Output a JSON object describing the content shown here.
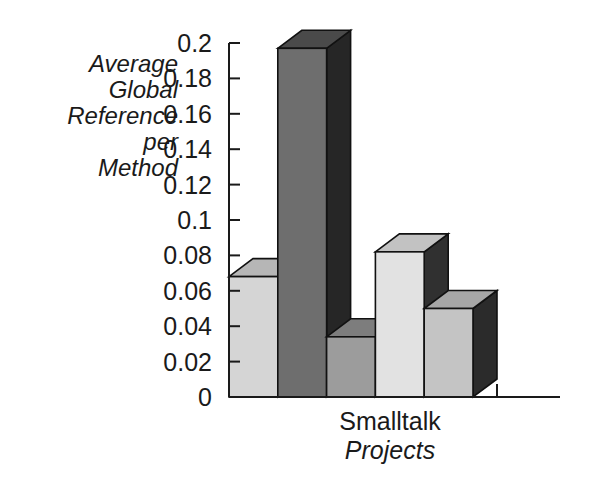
{
  "chart_data": {
    "type": "bar",
    "title": "",
    "subtitle": "",
    "xlabel_lines": [
      "Smalltalk",
      "Projects"
    ],
    "ylabel_lines": [
      "Average",
      "Global",
      "Reference",
      "per",
      "Method"
    ],
    "ylabel": "Average Global Reference per Method",
    "xlabel": "Smalltalk Projects",
    "categories": [
      "1",
      "2",
      "3",
      "4",
      "5"
    ],
    "values": [
      0.068,
      0.197,
      0.034,
      0.082,
      0.05
    ],
    "bar_colors": [
      "#d5d5d5",
      "#6e6e6e",
      "#9c9c9c",
      "#e2e2e2",
      "#c4c4c4"
    ],
    "bar_top_colors": [
      "#b6b6b6",
      "#4a4a4a",
      "#7d7d7d",
      "#c2c2c2",
      "#a6a6a6"
    ],
    "bar_side_colors": [
      "#4d4d4d",
      "#262626",
      "#3b3b3b",
      "#303030",
      "#2b2b2b"
    ],
    "ylim": [
      0,
      0.2
    ],
    "ytick_labels": [
      "0",
      "0.02",
      "0.04",
      "0.06",
      "0.08",
      "0.1",
      "0.12",
      "0.14",
      "0.16",
      "0.18",
      "0.2"
    ],
    "ytick_values": [
      0,
      0.02,
      0.04,
      0.06,
      0.08,
      0.1,
      0.12,
      0.14,
      0.16,
      0.18,
      0.2
    ],
    "grid": false,
    "legend": "none",
    "style": "3d-grayscale",
    "depth_label": "isometric-depth"
  },
  "axis_geometry": {
    "plot_left": 229,
    "plot_right": 473,
    "baseline_y": 397,
    "top_y": 43,
    "axis_x": 229,
    "depth_dx": 24,
    "depth_dy": -18,
    "x_axis_end": 560,
    "extra_tick_x": 497
  },
  "labels": {
    "ylabel_x": 178,
    "ylabel_first_y": 72,
    "ylabel_line_height": 26,
    "xlabel_x": 390,
    "xlabel_first_y": 430,
    "xlabel_line_height": 29,
    "ytick_label_x": 212
  }
}
